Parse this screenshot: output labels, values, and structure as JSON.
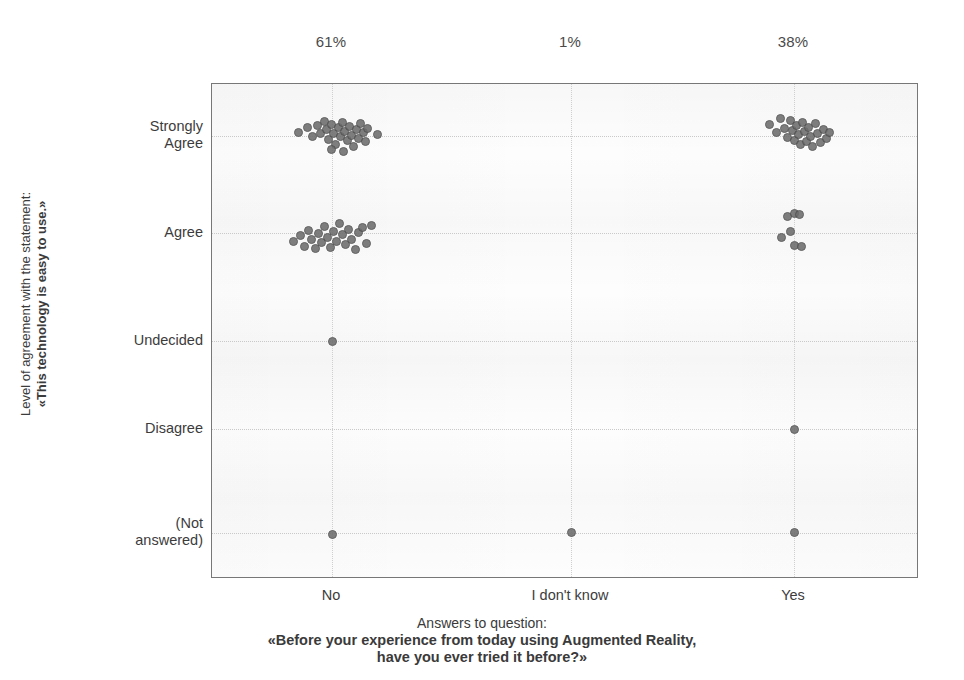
{
  "chart_data": {
    "type": "scatter",
    "title": "",
    "xlabel_lines": [
      "Answers to question:",
      "«Before your experience from today using Augmented Reality,",
      "have you ever tried it before?»"
    ],
    "ylabel_lines": [
      "Level of agreement with the statement:",
      "«This technology is easy to use.»"
    ],
    "grid": true,
    "legend": "none",
    "categories": [
      "No",
      "I don't know",
      "Yes"
    ],
    "category_percent_labels": [
      "61%",
      "1%",
      "38%"
    ],
    "y_categories": [
      "Strongly\nAgree",
      "Agree",
      "Undecided",
      "Disagree",
      "(Not\nanswered)"
    ],
    "y_category_plain": [
      "Strongly Agree",
      "Agree",
      "Undecided",
      "Disagree",
      "(Not answered)"
    ],
    "counts": {
      "No": {
        "Strongly Agree": 28,
        "Agree": 23,
        "Undecided": 1,
        "Disagree": 0,
        "(Not answered)": 1
      },
      "I don't know": {
        "Strongly Agree": 0,
        "Agree": 0,
        "Undecided": 0,
        "Disagree": 0,
        "(Not answered)": 1
      },
      "Yes": {
        "Strongly Agree": 23,
        "Agree": 7,
        "Undecided": 0,
        "Disagree": 1,
        "(Not answered)": 1
      }
    },
    "x_gridlines": [
      331,
      570,
      793
    ],
    "y_gridlines": [
      135,
      232,
      340,
      428,
      532
    ],
    "plot_box": {
      "left": 211,
      "top": 83,
      "width": 707,
      "height": 495
    },
    "points": [
      [
        297,
        131
      ],
      [
        306,
        126
      ],
      [
        311,
        135
      ],
      [
        316,
        124
      ],
      [
        319,
        132
      ],
      [
        323,
        120
      ],
      [
        325,
        128
      ],
      [
        327,
        138
      ],
      [
        330,
        123
      ],
      [
        332,
        132
      ],
      [
        334,
        143
      ],
      [
        337,
        126
      ],
      [
        339,
        135
      ],
      [
        341,
        121
      ],
      [
        343,
        130
      ],
      [
        346,
        139
      ],
      [
        348,
        125
      ],
      [
        350,
        134
      ],
      [
        352,
        145
      ],
      [
        355,
        128
      ],
      [
        357,
        137
      ],
      [
        359,
        122
      ],
      [
        362,
        131
      ],
      [
        364,
        140
      ],
      [
        366,
        127
      ],
      [
        330,
        148
      ],
      [
        342,
        150
      ],
      [
        376,
        133
      ],
      [
        292,
        240
      ],
      [
        299,
        234
      ],
      [
        303,
        245
      ],
      [
        307,
        229
      ],
      [
        310,
        238
      ],
      [
        314,
        247
      ],
      [
        317,
        232
      ],
      [
        320,
        241
      ],
      [
        323,
        225
      ],
      [
        326,
        236
      ],
      [
        329,
        246
      ],
      [
        332,
        230
      ],
      [
        335,
        240
      ],
      [
        338,
        222
      ],
      [
        341,
        233
      ],
      [
        344,
        243
      ],
      [
        347,
        228
      ],
      [
        350,
        238
      ],
      [
        354,
        248
      ],
      [
        357,
        231
      ],
      [
        361,
        226
      ],
      [
        365,
        242
      ],
      [
        370,
        224
      ],
      [
        331,
        340
      ],
      [
        331,
        533
      ],
      [
        570,
        531
      ],
      [
        768,
        123
      ],
      [
        775,
        131
      ],
      [
        779,
        117
      ],
      [
        783,
        127
      ],
      [
        786,
        136
      ],
      [
        789,
        119
      ],
      [
        791,
        129
      ],
      [
        793,
        139
      ],
      [
        795,
        124
      ],
      [
        797,
        133
      ],
      [
        799,
        143
      ],
      [
        801,
        121
      ],
      [
        803,
        130
      ],
      [
        805,
        140
      ],
      [
        807,
        126
      ],
      [
        809,
        135
      ],
      [
        811,
        145
      ],
      [
        814,
        122
      ],
      [
        816,
        132
      ],
      [
        819,
        141
      ],
      [
        822,
        128
      ],
      [
        825,
        137
      ],
      [
        828,
        131
      ],
      [
        786,
        215
      ],
      [
        793,
        212
      ],
      [
        798,
        213
      ],
      [
        789,
        230
      ],
      [
        780,
        236
      ],
      [
        793,
        244
      ],
      [
        800,
        245
      ],
      [
        793,
        428
      ],
      [
        793,
        531
      ]
    ]
  },
  "axis": {
    "x_tick_positions": [
      331,
      570,
      793
    ],
    "y_tick_positions": [
      135,
      232,
      340,
      428,
      532
    ]
  }
}
